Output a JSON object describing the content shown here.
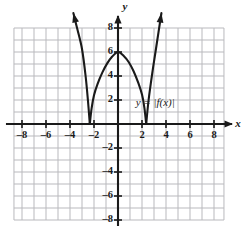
{
  "figure": {
    "width": 246,
    "height": 238,
    "background": "#ffffff",
    "ink_color": "#1a1a1a",
    "grid_color": "#b9b9bd"
  },
  "chart_data": {
    "type": "line",
    "title": "",
    "subtitle": "",
    "xlabel": "x",
    "ylabel": "y",
    "xlim": [
      -8.67,
      8.83
    ],
    "ylim": [
      -8.0,
      8.0
    ],
    "grid": true,
    "grid_step": 1,
    "legend_position": "inside-right",
    "x_ticks": [
      -8,
      -6,
      -4,
      -2,
      2,
      4,
      6,
      8
    ],
    "x_tick_labels": [
      "–8",
      "–6",
      "–4",
      "–2",
      "2",
      "4",
      "6",
      "8"
    ],
    "y_ticks": [
      8,
      6,
      4,
      2,
      -2,
      -4,
      -6,
      -8
    ],
    "y_tick_labels": [
      "8",
      "6",
      "4",
      "2",
      "–2",
      "–4",
      "–6",
      "–8"
    ],
    "annotations": [
      {
        "text": "y = |f(x)|",
        "x": 3.1,
        "y": 1.75
      }
    ],
    "series": [
      {
        "name": "y = |f(x)|",
        "color": "#1a1a1a",
        "arrow_start": true,
        "arrow_end": true,
        "description": "Absolute value of a downward parabola: V-shaped cusps on the x-axis at x = -2.35 and x = 2.35, a smooth maximum of 6 at x = 0, and straight rays rising to arrowheads at both ends.",
        "points": [
          {
            "x": -3.72,
            "y": 9.25
          },
          {
            "x": -3.4,
            "y": 7.95
          },
          {
            "x": -3.0,
            "y": 6.25
          },
          {
            "x": -2.7,
            "y": 4.0
          },
          {
            "x": -2.5,
            "y": 1.9
          },
          {
            "x": -2.35,
            "y": 0.0
          },
          {
            "x": -2.2,
            "y": 1.3
          },
          {
            "x": -2.0,
            "y": 2.4
          },
          {
            "x": -1.7,
            "y": 3.35
          },
          {
            "x": -1.3,
            "y": 4.3
          },
          {
            "x": -0.9,
            "y": 5.05
          },
          {
            "x": -0.5,
            "y": 5.6
          },
          {
            "x": 0.0,
            "y": 6.0
          },
          {
            "x": 0.5,
            "y": 5.65
          },
          {
            "x": 0.9,
            "y": 5.15
          },
          {
            "x": 1.3,
            "y": 4.4
          },
          {
            "x": 1.7,
            "y": 3.4
          },
          {
            "x": 2.0,
            "y": 2.45
          },
          {
            "x": 2.2,
            "y": 1.35
          },
          {
            "x": 2.35,
            "y": 0.0
          },
          {
            "x": 2.55,
            "y": 2.0
          },
          {
            "x": 2.85,
            "y": 4.2
          },
          {
            "x": 3.2,
            "y": 6.5
          },
          {
            "x": 3.62,
            "y": 9.25
          }
        ]
      }
    ]
  }
}
